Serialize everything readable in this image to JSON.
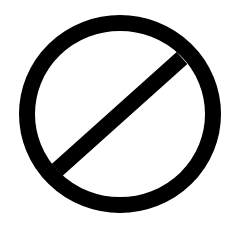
{
  "icon": {
    "name": "prohibited-icon",
    "label": "Prohibited",
    "colors": {
      "stroke": "#000000",
      "background": "#ffffff"
    },
    "geometry": {
      "center_x": 120,
      "center_y": 114,
      "ring_radius": 93,
      "ring_radius_y": 91,
      "stroke_width": 16,
      "slash": {
        "x1": 57,
        "y1": 170,
        "x2": 182,
        "y2": 58
      }
    }
  }
}
